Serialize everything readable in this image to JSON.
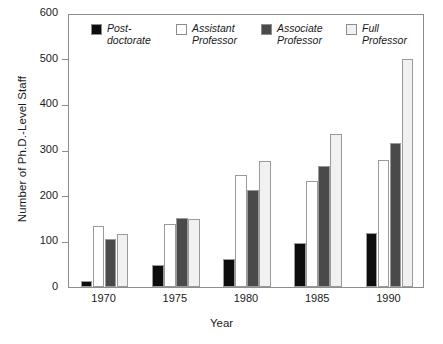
{
  "chart_data": {
    "type": "bar",
    "title": "",
    "xlabel": "Year",
    "ylabel": "Number of Ph.D.-Level Staff",
    "categories": [
      "1970",
      "1975",
      "1980",
      "1985",
      "1990"
    ],
    "ylim": [
      0,
      600
    ],
    "yticks": [
      0,
      100,
      200,
      300,
      400,
      500,
      600
    ],
    "ytick_labels": [
      "0",
      "100",
      "200",
      "300",
      "400",
      "500",
      "600"
    ],
    "grid": false,
    "legend_position": "top-inside",
    "series": [
      {
        "name": "Post-\ndoctorate",
        "legend_label": "Post-\ndoctorate",
        "color": "#0d0d0d",
        "values": [
          14,
          48,
          62,
          97,
          118
        ]
      },
      {
        "name": "Assistant\nProfessor",
        "legend_label": "Assistant\nProfessor",
        "color": "#ffffff",
        "values": [
          133,
          137,
          245,
          233,
          279
        ]
      },
      {
        "name": "Associate\nProfessor",
        "legend_label": "Associate\nProfessor",
        "color": "#4a4a4a",
        "values": [
          105,
          152,
          212,
          266,
          315
        ]
      },
      {
        "name": "Full\nProfessor",
        "legend_label": "Full\nProfessor",
        "color": "#f1f1f1",
        "values": [
          117,
          148,
          276,
          334,
          499
        ]
      }
    ]
  },
  "axes": {
    "frame_color": "#8d8d8d",
    "bar_outline_color": "#9a9a9a"
  }
}
